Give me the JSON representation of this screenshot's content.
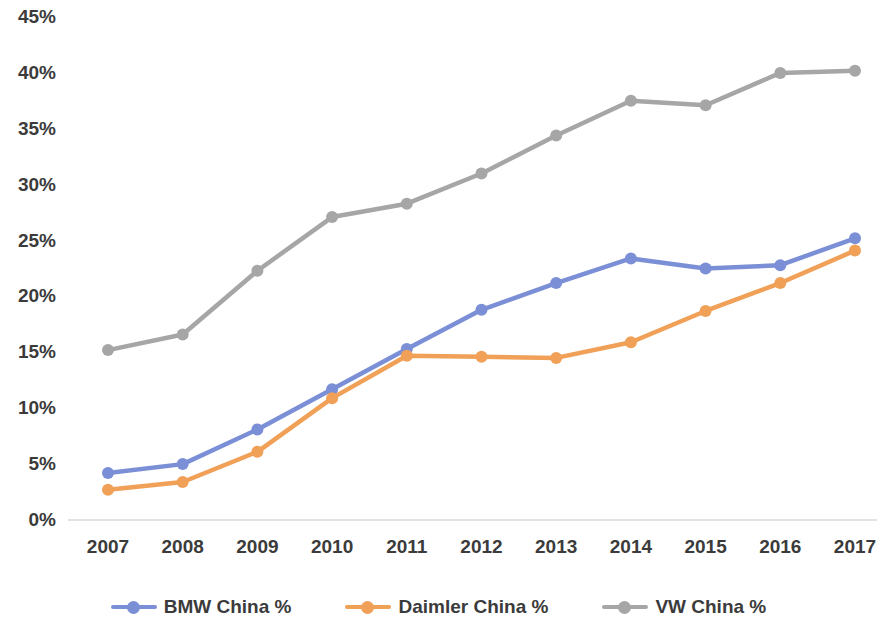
{
  "chart_data": {
    "type": "line",
    "title": "",
    "subtitle": "",
    "xlabel": "",
    "ylabel": "",
    "categories": [
      "2007",
      "2008",
      "2009",
      "2010",
      "2011",
      "2012",
      "2013",
      "2014",
      "2015",
      "2016",
      "2017"
    ],
    "x_tick_labels": [
      "2007",
      "2008",
      "2009",
      "2010",
      "2011",
      "2012",
      "2013",
      "2014",
      "2015",
      "2016",
      "2017"
    ],
    "y_tick_labels": [
      "0%",
      "5%",
      "10%",
      "15%",
      "20%",
      "25%",
      "30%",
      "35%",
      "40%",
      "45%"
    ],
    "y_tick_values": [
      0,
      5,
      10,
      15,
      20,
      25,
      30,
      35,
      40,
      45
    ],
    "ylim": [
      0,
      45
    ],
    "y_unit": "%",
    "grid": "zero-line-only",
    "legend_position": "bottom",
    "series": [
      {
        "name": "BMW China %",
        "color": "#7b8fd6",
        "values": [
          4.2,
          5.0,
          8.1,
          11.7,
          15.3,
          18.8,
          21.2,
          23.4,
          22.5,
          22.8,
          25.2
        ]
      },
      {
        "name": "Daimler China %",
        "color": "#f0a057",
        "values": [
          2.7,
          3.4,
          6.1,
          10.9,
          14.7,
          14.6,
          14.5,
          15.9,
          18.7,
          21.2,
          24.1
        ]
      },
      {
        "name": "VW China %",
        "color": "#a6a6a6",
        "values": [
          15.2,
          16.6,
          22.3,
          27.1,
          28.3,
          31.0,
          34.4,
          37.5,
          37.1,
          40.0,
          40.2
        ]
      }
    ]
  },
  "legend": {
    "items": [
      {
        "label": "BMW China %",
        "icon": "line-marker-icon"
      },
      {
        "label": "Daimler China %",
        "icon": "line-marker-icon"
      },
      {
        "label": "VW China %",
        "icon": "line-marker-icon"
      }
    ]
  },
  "colors": {
    "bmw": "#7b8fd6",
    "daimler": "#f0a057",
    "vw": "#a6a6a6",
    "axis_text": "#3b3b3b",
    "gridline": "#d9d9d9",
    "background": "#ffffff"
  }
}
